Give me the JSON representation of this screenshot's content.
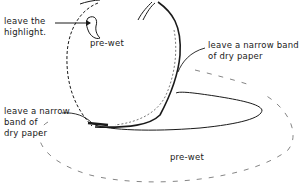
{
  "diagram": {
    "stroke_color": "#1a1a1a",
    "dash_color": "#555555",
    "background": "#ffffff"
  },
  "labels": {
    "highlight": "leave the\nhighlight.",
    "pre_wet_apple": "pre-wet",
    "right_band": "leave a narrow band\nof dry paper",
    "left_band": "leave a narrow\nband of\ndry paper",
    "pre_wet_ground": "pre-wet"
  }
}
